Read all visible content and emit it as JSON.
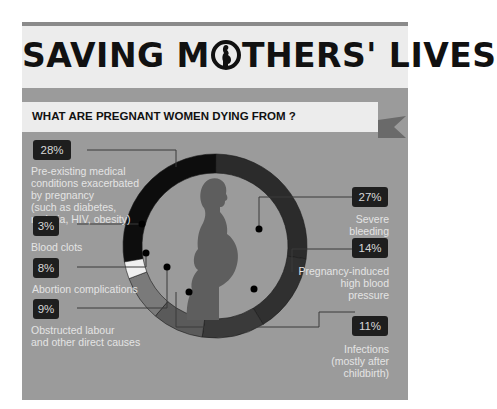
{
  "header": {
    "title_part1": "SAVING M",
    "title_part2": "THERS' LIVES",
    "logo_icon": "pregnant-woman-in-circle-icon"
  },
  "subtitle": "WHAT ARE PREGNANT WOMEN DYING FROM ?",
  "chart_data": {
    "type": "pie",
    "variant": "donut",
    "title": "WHAT ARE PREGNANT WOMEN DYING FROM ?",
    "categories": [
      "Pre-existing medical conditions exacerbated by pregnancy (such as diabetes, malaria, HIV, obesity)",
      "Severe bleeding",
      "Pregnancy-induced high blood pressure",
      "Infections (mostly after childbirth)",
      "Obstructed labour and other direct causes",
      "Abortion complications",
      "Blood clots"
    ],
    "values": [
      28,
      27,
      14,
      11,
      9,
      8,
      3
    ],
    "unit": "%",
    "colors": [
      "#0d0d0d",
      "#2b2b2b",
      "#303030",
      "#3a3a3a",
      "#5a5a5a",
      "#7a7a7a",
      "#f0f0f0"
    ],
    "center_image": "pregnant-woman-silhouette"
  },
  "labels": {
    "pre_existing": {
      "pct": "28%",
      "line1": "Pre-existing medical",
      "line2": "conditions exacerbated",
      "line3": "by pregnancy",
      "line4": "(such as diabetes,",
      "line5": "malaria, HIV, obesity)"
    },
    "blood_clots": {
      "pct": "3%",
      "line1": "Blood clots"
    },
    "abortion": {
      "pct": "8%",
      "line1": "Abortion complications"
    },
    "obstructed": {
      "pct": "9%",
      "line1": "Obstructed labour",
      "line2": "and other direct causes"
    },
    "bleeding": {
      "pct": "27%",
      "line1": "Severe",
      "line2": "bleeding"
    },
    "hypertension": {
      "pct": "14%",
      "line1": "Pregnancy-induced",
      "line2": "high blood",
      "line3": "pressure"
    },
    "infections": {
      "pct": "11%",
      "line1": "Infections",
      "line2": "(mostly after",
      "line3": "childbirth)"
    }
  }
}
